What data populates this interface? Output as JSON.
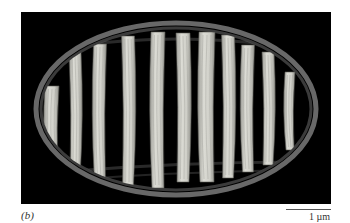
{
  "figure": {
    "panel_label": "(b)",
    "scale_bar": {
      "label": "1 µm"
    },
    "colors": {
      "background": "#000000",
      "membrane": "#8a8a8a",
      "cristae": "#d6d6cf",
      "cristae_shadow": "#9a9a94"
    },
    "cristae": [
      {
        "x": 52,
        "top": 86,
        "bottom": 170,
        "w": 14
      },
      {
        "x": 75,
        "top": 52,
        "bottom": 178,
        "w": 12
      },
      {
        "x": 100,
        "top": 44,
        "bottom": 183,
        "w": 13
      },
      {
        "x": 128,
        "top": 36,
        "bottom": 185,
        "w": 13
      },
      {
        "x": 158,
        "top": 32,
        "bottom": 188,
        "w": 14
      },
      {
        "x": 183,
        "top": 33,
        "bottom": 182,
        "w": 14
      },
      {
        "x": 207,
        "top": 32,
        "bottom": 182,
        "w": 16
      },
      {
        "x": 228,
        "top": 35,
        "bottom": 178,
        "w": 13
      },
      {
        "x": 248,
        "top": 45,
        "bottom": 172,
        "w": 13
      },
      {
        "x": 268,
        "top": 52,
        "bottom": 165,
        "w": 12
      },
      {
        "x": 290,
        "top": 72,
        "bottom": 150,
        "w": 10
      }
    ]
  }
}
